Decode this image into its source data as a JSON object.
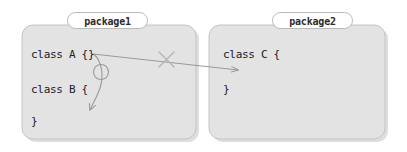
{
  "canvas": {
    "width": 407,
    "height": 152,
    "background": "#ffffff"
  },
  "theme": {
    "package_fill": "#e3e3e3",
    "package_stroke": "#c2c2c2",
    "package_shadow": "#d0d0d0",
    "label_fill": "#ffffff",
    "label_stroke": "#b9b9b9",
    "text_color": "#212121",
    "arrow_color": "#9a9a9a",
    "cross_color": "#b5b5b5",
    "circle_color": "#9a9a9a"
  },
  "packages": [
    {
      "id": "package1",
      "label": "package1",
      "box": {
        "x": 22,
        "y": 25,
        "width": 174,
        "height": 114
      },
      "code_lines": [
        "class A {}",
        "class B {",
        "}"
      ]
    },
    {
      "id": "package2",
      "label": "package2",
      "box": {
        "x": 209,
        "y": 25,
        "width": 176,
        "height": 114
      },
      "code_lines": [
        "class C {",
        "}"
      ]
    }
  ],
  "annotations": {
    "forbidden_dependency": {
      "name": "cross-package-arrow",
      "from": "class A {}",
      "to": "class C {",
      "start": {
        "x": 93,
        "y": 54
      },
      "end": {
        "x": 238,
        "y": 70
      },
      "marker": "arrowhead",
      "blocked": true,
      "cross_mark": {
        "x": 166,
        "y": 59,
        "size": 15
      }
    },
    "allowed_dependency": {
      "name": "intra-package-arrow",
      "from": "class A {}",
      "to": "class B {",
      "start": {
        "x": 94,
        "y": 54
      },
      "end": {
        "x": 97,
        "y": 109
      },
      "marker": "arrowhead",
      "blocked": false,
      "circle_mark": {
        "x": 100,
        "y": 72,
        "r": 7
      }
    }
  }
}
